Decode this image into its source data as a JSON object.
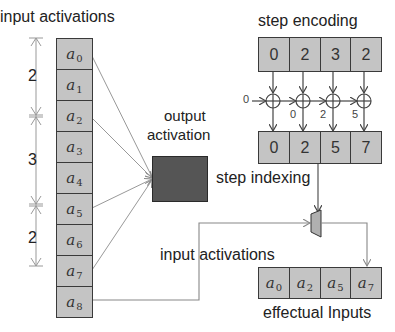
{
  "labels": {
    "input_activations_top": "input activations",
    "step_encoding": "step encoding",
    "output_activation_line1": "output",
    "output_activation_line2": "activation",
    "step_indexing": "step indexing",
    "input_activations_mid": "input activations",
    "effectual_inputs": "effectual Inputs"
  },
  "input_column": [
    {
      "base": "a",
      "sub": "0"
    },
    {
      "base": "a",
      "sub": "1"
    },
    {
      "base": "a",
      "sub": "2"
    },
    {
      "base": "a",
      "sub": "3"
    },
    {
      "base": "a",
      "sub": "4"
    },
    {
      "base": "a",
      "sub": "5"
    },
    {
      "base": "a",
      "sub": "6"
    },
    {
      "base": "a",
      "sub": "7"
    },
    {
      "base": "a",
      "sub": "8"
    }
  ],
  "step_dimensions": [
    "2",
    "3",
    "2"
  ],
  "step_encoding": [
    "0",
    "2",
    "3",
    "2"
  ],
  "adder_chain": {
    "initial_input": "0",
    "carry_labels": [
      "0",
      "2",
      "5"
    ]
  },
  "step_indexing": [
    "0",
    "2",
    "5",
    "7"
  ],
  "effectual_inputs": [
    {
      "base": "a",
      "sub": "0"
    },
    {
      "base": "a",
      "sub": "2"
    },
    {
      "base": "a",
      "sub": "5"
    },
    {
      "base": "a",
      "sub": "7"
    }
  ],
  "colors": {
    "cell_fill": "#c4c4c4",
    "cell_border": "#3a3a3a",
    "output_box": "#555555",
    "line": "#8a8a8a",
    "arrow": "#555555"
  }
}
